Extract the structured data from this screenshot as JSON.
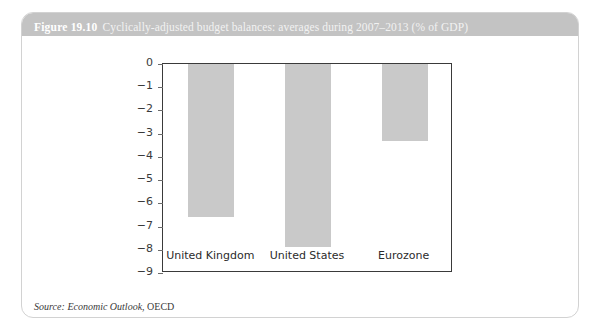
{
  "figure": {
    "number": "Figure 19.10",
    "title": "Cyclically-adjusted budget balances: averages during 2007–2013 (% of GDP)",
    "source_lead": "Source:",
    "source_publication": "Economic Outlook",
    "source_org": ", OECD"
  },
  "chart_data": {
    "type": "bar",
    "title": "Cyclically-adjusted budget balances: averages during 2007–2013 (% of GDP)",
    "categories": [
      "United Kingdom",
      "United States",
      "Eurozone"
    ],
    "values": [
      -6.6,
      -7.9,
      -3.3
    ],
    "xlabel": "",
    "ylabel": "",
    "ylim": [
      -9,
      0
    ],
    "yticks": [
      0,
      -1,
      -2,
      -3,
      -4,
      -5,
      -6,
      -7,
      -8,
      -9
    ],
    "ytick_labels": [
      "0",
      "−1",
      "−2",
      "−3",
      "−4",
      "−5",
      "−6",
      "−7",
      "−8",
      "−9"
    ],
    "grid": false,
    "legend": null,
    "bar_color": "#c9c9c9",
    "axis_color": "#3a3a3a",
    "units": "% of GDP"
  },
  "style": {
    "caption_band_color": "#c3c3c3",
    "frame_border_color": "#d2d2d2",
    "page_background": "#ffffff"
  }
}
